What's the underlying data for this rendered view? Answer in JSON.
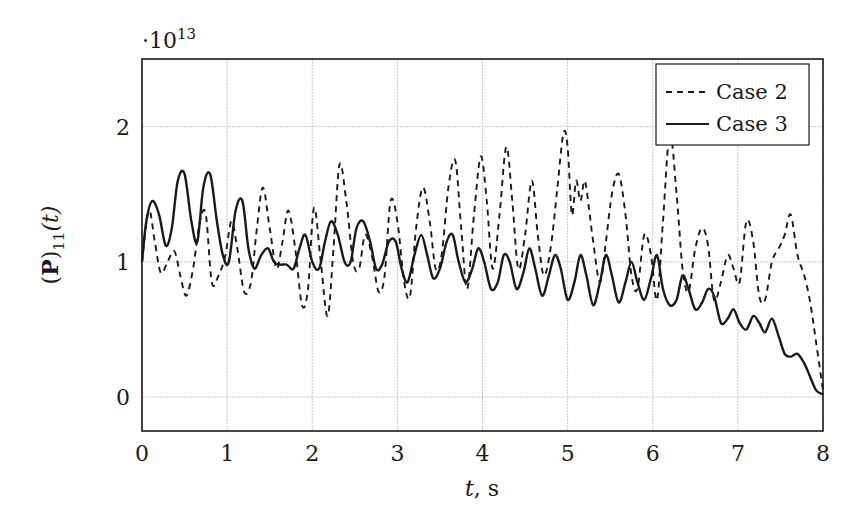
{
  "chart_data": {
    "type": "line",
    "title": "",
    "xlabel": "t, s",
    "ylabel": "(P)11(t)",
    "ylabel_parts": {
      "open": "(",
      "bold": "P",
      "close": ")",
      "sub": "11",
      "arg": "(t)"
    },
    "y_multiplier": "·10",
    "y_multiplier_exp": "13",
    "xlim": [
      0,
      8
    ],
    "ylim": [
      -0.25,
      2.5
    ],
    "x_ticks": [
      "0",
      "1",
      "2",
      "3",
      "4",
      "5",
      "6",
      "7",
      "8"
    ],
    "y_ticks": [
      "0",
      "1",
      "2"
    ],
    "grid": true,
    "legend_position": "upper right",
    "series": [
      {
        "name": "Case 2",
        "style": "dashed",
        "color": "#1a1a1a",
        "x": [
          0,
          0.08,
          0.15,
          0.22,
          0.3,
          0.38,
          0.45,
          0.52,
          0.6,
          0.68,
          0.75,
          0.82,
          0.9,
          0.98,
          1.05,
          1.12,
          1.2,
          1.28,
          1.35,
          1.42,
          1.5,
          1.58,
          1.65,
          1.72,
          1.8,
          1.88,
          1.95,
          2.02,
          2.1,
          2.18,
          2.25,
          2.32,
          2.4,
          2.48,
          2.55,
          2.62,
          2.7,
          2.78,
          2.85,
          2.92,
          3.0,
          3.08,
          3.15,
          3.22,
          3.3,
          3.38,
          3.45,
          3.52,
          3.6,
          3.68,
          3.75,
          3.82,
          3.9,
          3.98,
          4.05,
          4.12,
          4.2,
          4.28,
          4.35,
          4.42,
          4.5,
          4.58,
          4.65,
          4.72,
          4.8,
          4.88,
          4.95,
          5.0,
          5.05,
          5.1,
          5.15,
          5.2,
          5.25,
          5.3,
          5.38,
          5.45,
          5.52,
          5.6,
          5.68,
          5.75,
          5.82,
          5.9,
          5.98,
          6.05,
          6.12,
          6.2,
          6.28,
          6.35,
          6.42,
          6.5,
          6.58,
          6.65,
          6.72,
          6.8,
          6.88,
          6.95,
          7.02,
          7.1,
          7.18,
          7.25,
          7.32,
          7.4,
          7.48,
          7.55,
          7.62,
          7.7,
          7.78,
          7.85,
          7.92,
          8.0
        ],
        "values": [
          1.0,
          1.38,
          1.15,
          0.92,
          1.0,
          1.08,
          0.9,
          0.75,
          0.95,
          1.3,
          1.35,
          0.85,
          0.9,
          1.05,
          1.3,
          1.1,
          0.78,
          0.85,
          1.25,
          1.55,
          1.25,
          0.95,
          1.15,
          1.38,
          1.1,
          0.68,
          0.8,
          1.4,
          1.0,
          0.6,
          1.1,
          1.72,
          1.45,
          1.0,
          0.95,
          1.2,
          1.05,
          0.78,
          0.9,
          1.45,
          1.3,
          0.85,
          0.75,
          1.25,
          1.55,
          1.3,
          0.95,
          1.05,
          1.55,
          1.75,
          1.25,
          0.8,
          1.35,
          1.78,
          1.45,
          0.95,
          1.35,
          1.85,
          1.45,
          0.95,
          1.2,
          1.6,
          1.2,
          0.9,
          1.1,
          1.55,
          1.95,
          1.85,
          1.35,
          1.6,
          1.45,
          1.6,
          1.4,
          1.15,
          0.85,
          1.15,
          1.5,
          1.65,
          1.35,
          0.9,
          0.8,
          1.2,
          1.05,
          0.72,
          1.3,
          1.95,
          1.5,
          0.95,
          0.78,
          1.1,
          1.25,
          1.12,
          0.72,
          0.85,
          1.05,
          0.95,
          0.85,
          1.3,
          1.15,
          0.75,
          0.72,
          1.0,
          1.1,
          1.2,
          1.35,
          1.05,
          0.9,
          0.7,
          0.4,
          0.05
        ]
      },
      {
        "name": "Case 3",
        "style": "solid",
        "color": "#1a1a1a",
        "x": [
          0,
          0.05,
          0.12,
          0.2,
          0.28,
          0.35,
          0.42,
          0.5,
          0.58,
          0.65,
          0.72,
          0.8,
          0.88,
          0.95,
          1.02,
          1.1,
          1.18,
          1.25,
          1.32,
          1.4,
          1.48,
          1.55,
          1.62,
          1.7,
          1.78,
          1.85,
          1.92,
          2.0,
          2.08,
          2.15,
          2.22,
          2.3,
          2.38,
          2.45,
          2.52,
          2.6,
          2.68,
          2.75,
          2.82,
          2.9,
          2.98,
          3.05,
          3.12,
          3.2,
          3.28,
          3.35,
          3.42,
          3.5,
          3.58,
          3.65,
          3.72,
          3.8,
          3.88,
          3.95,
          4.02,
          4.1,
          4.18,
          4.25,
          4.32,
          4.4,
          4.48,
          4.55,
          4.62,
          4.7,
          4.78,
          4.85,
          4.92,
          5.0,
          5.08,
          5.15,
          5.22,
          5.3,
          5.38,
          5.45,
          5.52,
          5.6,
          5.68,
          5.75,
          5.82,
          5.9,
          5.98,
          6.05,
          6.12,
          6.2,
          6.28,
          6.35,
          6.42,
          6.5,
          6.58,
          6.65,
          6.72,
          6.8,
          6.88,
          6.95,
          7.02,
          7.1,
          7.18,
          7.25,
          7.32,
          7.4,
          7.48,
          7.55,
          7.62,
          7.7,
          7.78,
          7.85,
          7.92,
          8.0
        ],
        "values": [
          1.0,
          1.3,
          1.45,
          1.35,
          1.12,
          1.25,
          1.6,
          1.65,
          1.3,
          1.15,
          1.55,
          1.65,
          1.3,
          1.05,
          1.0,
          1.38,
          1.45,
          1.1,
          0.95,
          1.05,
          1.1,
          1.0,
          0.98,
          0.98,
          0.95,
          1.1,
          1.2,
          1.0,
          0.95,
          1.15,
          1.3,
          1.2,
          1.0,
          1.0,
          1.25,
          1.3,
          1.15,
          0.95,
          0.98,
          1.15,
          1.15,
          0.95,
          0.85,
          1.05,
          1.2,
          1.05,
          0.88,
          0.95,
          1.15,
          1.2,
          1.0,
          0.85,
          0.95,
          1.1,
          1.0,
          0.8,
          0.85,
          1.05,
          1.0,
          0.8,
          0.92,
          1.1,
          0.95,
          0.75,
          0.9,
          1.05,
          0.95,
          0.72,
          0.85,
          1.05,
          0.9,
          0.68,
          0.85,
          1.05,
          0.9,
          0.7,
          0.85,
          1.0,
          0.85,
          0.72,
          0.88,
          1.05,
          0.8,
          0.68,
          0.72,
          0.9,
          0.8,
          0.65,
          0.7,
          0.8,
          0.75,
          0.55,
          0.58,
          0.65,
          0.55,
          0.5,
          0.6,
          0.55,
          0.48,
          0.58,
          0.45,
          0.32,
          0.3,
          0.32,
          0.25,
          0.15,
          0.05,
          0.02
        ]
      }
    ]
  },
  "legend": {
    "items": [
      {
        "label": "Case 2",
        "style": "dashed"
      },
      {
        "label": "Case 3",
        "style": "solid"
      }
    ]
  },
  "axes": {
    "xlabel_italic": "t",
    "xlabel_rest": ", s"
  }
}
